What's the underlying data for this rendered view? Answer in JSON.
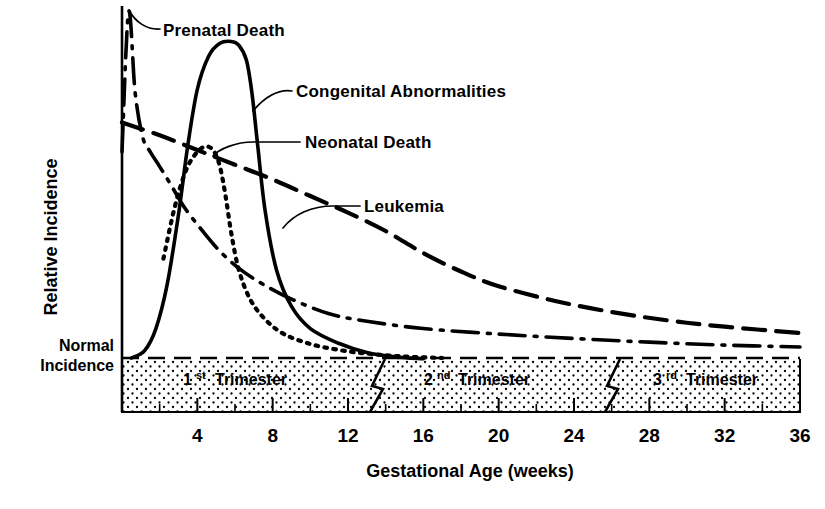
{
  "chart_data": {
    "type": "line",
    "title": "",
    "xlabel": "Gestational Age (weeks)",
    "ylabel": "Relative Incidence",
    "xlim": [
      0,
      36
    ],
    "ylim": [
      0,
      1
    ],
    "grid": false,
    "legend_position": "inline-annotations",
    "x_ticks": [
      "4",
      "8",
      "12",
      "16",
      "20",
      "24",
      "28",
      "32",
      "36"
    ],
    "x_tick_values": [
      4,
      8,
      12,
      16,
      20,
      24,
      28,
      32,
      36
    ],
    "x_minor_tick_values": [
      2,
      6,
      10,
      14,
      18,
      22,
      26,
      30,
      34
    ],
    "y_ticks": [],
    "baseline_label_lines": [
      "Normal",
      "Incidence"
    ],
    "baseline_value": 0.06,
    "series": [
      {
        "name": "Prenatal Death",
        "style": "dash-dot",
        "x": [
          0.0,
          0.35,
          0.7,
          1.1,
          1.5,
          2.0,
          2.6,
          3.3,
          4.2,
          5.2,
          6.3,
          7.5,
          9.0,
          11.0,
          13.0,
          16.0,
          20.0,
          24.0,
          28.0,
          32.0,
          36.0
        ],
        "y": [
          0.62,
          1.0,
          0.78,
          0.66,
          0.62,
          0.58,
          0.53,
          0.47,
          0.41,
          0.35,
          0.3,
          0.26,
          0.22,
          0.18,
          0.16,
          0.14,
          0.125,
          0.113,
          0.103,
          0.095,
          0.09
        ]
      },
      {
        "name": "Congenital Abnormalities",
        "style": "solid",
        "x": [
          0.5,
          1.2,
          1.8,
          2.4,
          3.0,
          3.5,
          4.0,
          4.6,
          5.2,
          5.8,
          6.2,
          6.6,
          6.9,
          7.2,
          7.6,
          8.2,
          9.0,
          10.0,
          11.5,
          13.0,
          14.5,
          16.0
        ],
        "y": [
          0.06,
          0.08,
          0.14,
          0.26,
          0.45,
          0.64,
          0.79,
          0.88,
          0.915,
          0.92,
          0.91,
          0.87,
          0.78,
          0.64,
          0.46,
          0.3,
          0.2,
          0.14,
          0.1,
          0.075,
          0.063,
          0.058
        ]
      },
      {
        "name": "Neonatal Death",
        "style": "dotted",
        "x": [
          2.2,
          2.8,
          3.4,
          4.0,
          4.5,
          4.9,
          5.2,
          5.5,
          5.8,
          6.2,
          6.8,
          7.6,
          8.6,
          10.0,
          11.5,
          13.0,
          15.0,
          17.0
        ],
        "y": [
          0.33,
          0.47,
          0.57,
          0.62,
          0.635,
          0.62,
          0.58,
          0.5,
          0.4,
          0.3,
          0.22,
          0.165,
          0.125,
          0.098,
          0.082,
          0.072,
          0.064,
          0.06
        ]
      },
      {
        "name": "Leukemia",
        "style": "dashed",
        "x": [
          0.0,
          2.0,
          4.0,
          6.0,
          8.0,
          10.0,
          12.0,
          14.0,
          16.0,
          18.0,
          20.0,
          23.0,
          26.0,
          29.0,
          32.0,
          36.0
        ],
        "y": [
          0.7,
          0.665,
          0.625,
          0.585,
          0.545,
          0.5,
          0.455,
          0.405,
          0.345,
          0.295,
          0.255,
          0.215,
          0.185,
          0.162,
          0.145,
          0.128
        ]
      }
    ],
    "annotations": [
      {
        "label": "Prenatal Death",
        "x_px": 163,
        "y_px": 40
      },
      {
        "label": "Congenital Abnormalities",
        "x_px": 296,
        "y_px": 98
      },
      {
        "label": "Neonatal Death",
        "x_px": 305,
        "y_px": 148
      },
      {
        "label": "Leukemia",
        "x_px": 364,
        "y_px": 212
      }
    ],
    "band_regions": [
      {
        "label": "1st Trimester",
        "ordinal": "1",
        "suffix": "st",
        "start_week": 0,
        "end_week": 13.2
      },
      {
        "label": "2nd Trimester",
        "ordinal": "2",
        "suffix": "nd",
        "start_week": 13.2,
        "end_week": 25.6
      },
      {
        "label": "3rd Trimester",
        "ordinal": "3",
        "suffix": "rd",
        "start_week": 25.6,
        "end_week": 36
      }
    ]
  },
  "figure": {
    "y_axis_title": "Relative Incidence",
    "x_axis_title": "Gestational Age (weeks)",
    "normal_line_1": "Normal",
    "normal_line_2": "Incidence",
    "annotation_prenatal": "Prenatal Death",
    "annotation_congenital": "Congenital Abnormalities",
    "annotation_neonatal": "Neonatal Death",
    "annotation_leukemia": "Leukemia",
    "trimester_1_num": "1",
    "trimester_1_sup": "st",
    "trimester_1_word": "Trimester",
    "trimester_2_num": "2",
    "trimester_2_sup": "nd",
    "trimester_2_word": "Trimester",
    "trimester_3_num": "3",
    "trimester_3_sup": "rd",
    "trimester_3_word": "Trimester",
    "tick_4": "4",
    "tick_8": "8",
    "tick_12": "12",
    "tick_16": "16",
    "tick_20": "20",
    "tick_24": "24",
    "tick_28": "28",
    "tick_32": "32",
    "tick_36": "36",
    "ink_color": "#000000",
    "background_color": "#ffffff"
  }
}
